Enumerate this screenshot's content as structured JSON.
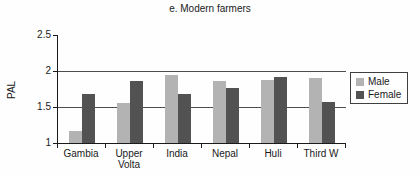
{
  "chart_data": {
    "type": "bar",
    "title": "e. Modern farmers",
    "categories": [
      "Gambia",
      "Upper Volta",
      "India",
      "Nepal",
      "Huli",
      "Third W"
    ],
    "series": [
      {
        "name": "Male",
        "color": "#b3b3b3",
        "values": [
          1.17,
          1.55,
          1.95,
          1.86,
          1.88,
          1.9
        ]
      },
      {
        "name": "Female",
        "color": "#525252",
        "values": [
          1.68,
          1.86,
          1.68,
          1.76,
          1.92,
          1.57
        ]
      }
    ],
    "xlabel": "",
    "ylabel": "PAL",
    "ylim": [
      1,
      2.5
    ],
    "yticks": [
      2.5,
      2,
      1.5,
      1
    ],
    "grid": true,
    "legend_position": "right"
  }
}
